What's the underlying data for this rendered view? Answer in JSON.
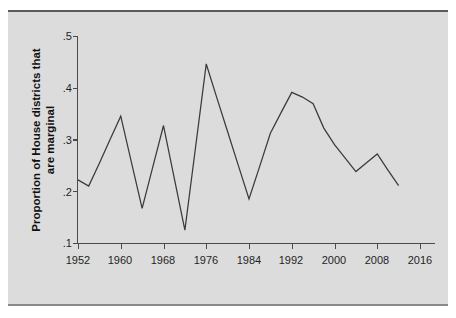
{
  "figure": {
    "background_color": "#dcdcdc",
    "page_color": "#ffffff",
    "line_color": "#3a3a3a",
    "axis_color": "#4a4a4a"
  },
  "labels": {
    "ylabel_line1": "Proportion of House districts that",
    "ylabel_line2": "are marginal",
    "ytick_1": ".1",
    "ytick_2": ".2",
    "ytick_3": ".3",
    "ytick_4": ".4",
    "ytick_5": ".5",
    "xtick_1": "1952",
    "xtick_2": "1960",
    "xtick_3": "1968",
    "xtick_4": "1976",
    "xtick_5": "1984",
    "xtick_6": "1992",
    "xtick_7": "2000",
    "xtick_8": "2008",
    "xtick_9": "2016"
  },
  "chart_data": {
    "type": "line",
    "title": "",
    "subtitle": "",
    "xlabel": "",
    "ylabel": "Proportion of House districts that are marginal",
    "xlim": [
      1950,
      2017
    ],
    "ylim": [
      0.1,
      0.5
    ],
    "xticks": [
      1952,
      1960,
      1968,
      1976,
      1984,
      1992,
      2000,
      2008,
      2016
    ],
    "xticklabels": [
      "1952",
      "1960",
      "1968",
      "1976",
      "1984",
      "1992",
      "2000",
      "2008",
      "2016"
    ],
    "yticks": [
      0.1,
      0.2,
      0.3,
      0.4,
      0.5
    ],
    "yticklabels": [
      ".1",
      ".2",
      ".3",
      ".4",
      ".5"
    ],
    "grid": false,
    "legend": false,
    "legend_position": "none",
    "x": [
      1952,
      1954,
      1956,
      1958,
      1960,
      1962,
      1964,
      1966,
      1968,
      1970,
      1972,
      1974,
      1976,
      1978,
      1980,
      1982,
      1984,
      1986,
      1988,
      1990,
      1992,
      1994,
      1996,
      1998,
      2000,
      2002,
      2004,
      2006,
      2008,
      2010,
      2012
    ],
    "values": [
      0.222,
      0.21,
      0.254,
      0.3,
      0.345,
      0.256,
      0.167,
      0.247,
      0.327,
      0.226,
      0.125,
      0.285,
      0.446,
      0.38,
      0.315,
      0.25,
      0.185,
      0.248,
      0.312,
      0.352,
      0.391,
      0.382,
      0.369,
      0.322,
      0.29,
      0.264,
      0.238,
      0.255,
      0.272,
      0.241,
      0.211
    ],
    "series": [
      {
        "name": "Proportion marginal",
        "color": "#3a3a3a",
        "values": [
          0.222,
          0.21,
          0.254,
          0.3,
          0.345,
          0.256,
          0.167,
          0.247,
          0.327,
          0.226,
          0.125,
          0.285,
          0.446,
          0.38,
          0.315,
          0.25,
          0.185,
          0.248,
          0.312,
          0.352,
          0.391,
          0.382,
          0.369,
          0.322,
          0.29,
          0.264,
          0.238,
          0.255,
          0.272,
          0.241,
          0.211
        ]
      }
    ]
  }
}
